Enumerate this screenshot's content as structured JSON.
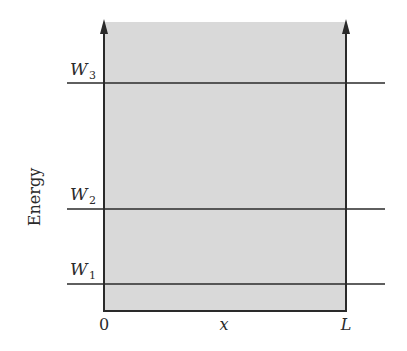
{
  "diagram": {
    "type": "infinite-square-well-energy-levels",
    "y_axis_label": "Energy",
    "x_axis": {
      "label": "x",
      "ticks": [
        {
          "label": "0",
          "position": "left-wall"
        },
        {
          "label": "L",
          "position": "right-wall"
        }
      ]
    },
    "energy_levels": [
      {
        "symbol": "W",
        "subscript": "3",
        "name": "W3"
      },
      {
        "symbol": "W",
        "subscript": "2",
        "name": "W2"
      },
      {
        "symbol": "W",
        "subscript": "1",
        "name": "W1"
      }
    ],
    "colors": {
      "well_fill": "#d9d9d9",
      "line": "#2a2a2a",
      "background": "#ffffff"
    }
  }
}
